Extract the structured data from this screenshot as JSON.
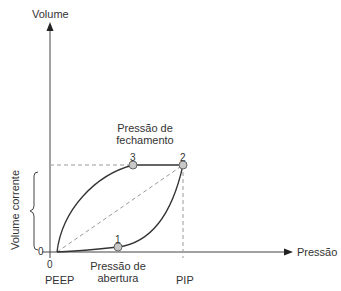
{
  "diagram": {
    "type": "pressure-volume loop",
    "y_axis_label": "Volume",
    "x_axis_label": "Pressão",
    "y_origin_tick": "0",
    "x_origin_tick": "0",
    "x_labels": {
      "peep": "PEEP",
      "opening_pressure_line1": "Pressão de",
      "opening_pressure_line2": "abertura",
      "pip": "PIP"
    },
    "closing_pressure_line1": "Pressão de",
    "closing_pressure_line2": "fechamento",
    "tidal_volume_label": "Volume corrente",
    "points": [
      {
        "id": "1",
        "label": "1",
        "description": "Pressão de abertura"
      },
      {
        "id": "2",
        "label": "2",
        "description": "PIP / volume máximo"
      },
      {
        "id": "3",
        "label": "3",
        "description": "Pressão de fechamento"
      }
    ],
    "colors": {
      "line": "#333333",
      "dashed": "#999999",
      "point_fill": "#c8c8c8",
      "point_stroke": "#666666"
    }
  }
}
